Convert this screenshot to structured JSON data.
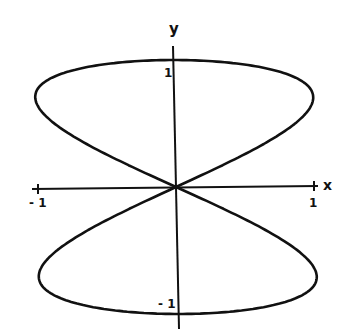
{
  "chart_data": {
    "type": "line",
    "title": "",
    "xlabel": "x",
    "ylabel": "y",
    "xlim": [
      -1,
      1
    ],
    "ylim": [
      -1,
      1
    ],
    "x_ticks": [
      "-1",
      "1"
    ],
    "y_ticks": [
      "1",
      "-1"
    ],
    "grid": false,
    "legend": null,
    "series": [
      {
        "name": "curve",
        "parametric": {
          "x": "sin(2t)",
          "y": "sin(t)",
          "t_range": [
            0,
            6.2832
          ]
        },
        "points": [
          [
            0,
            0
          ],
          [
            0.5,
            0.259
          ],
          [
            0.866,
            0.5
          ],
          [
            1.0,
            0.707
          ],
          [
            0.866,
            0.866
          ],
          [
            0.5,
            0.966
          ],
          [
            0,
            1
          ],
          [
            -0.5,
            0.966
          ],
          [
            -0.866,
            0.866
          ],
          [
            -1.0,
            0.707
          ],
          [
            -0.866,
            0.5
          ],
          [
            -0.5,
            0.259
          ],
          [
            0,
            0
          ],
          [
            0.5,
            -0.259
          ],
          [
            0.866,
            -0.5
          ],
          [
            1.0,
            -0.707
          ],
          [
            0.866,
            -0.866
          ],
          [
            0.5,
            -0.966
          ],
          [
            0,
            -1
          ],
          [
            -0.5,
            -0.966
          ],
          [
            -0.866,
            -0.866
          ],
          [
            -1.0,
            -0.707
          ],
          [
            -0.866,
            -0.5
          ],
          [
            -0.5,
            -0.259
          ],
          [
            0,
            0
          ]
        ]
      }
    ]
  },
  "labels": {
    "x_axis": "x",
    "y_axis": "y",
    "x_neg_one": "- 1",
    "x_pos_one": "1",
    "y_pos_one": "1",
    "y_neg_one": "- 1"
  },
  "colors": {
    "ink": "#111111",
    "background": "#ffffff"
  }
}
